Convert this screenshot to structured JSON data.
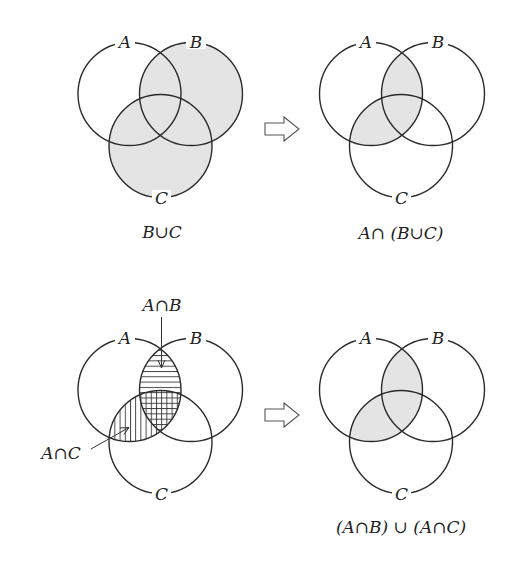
{
  "figure": {
    "panels": [
      {
        "id": "b-union-c",
        "position": "top-left",
        "caption": "B∪C",
        "shaded_region": "B∪C",
        "circle_labels": {
          "a": "A",
          "b": "B",
          "c": "C"
        }
      },
      {
        "id": "a-intersect-b-union-c",
        "position": "top-right",
        "caption": "A∩ (B∪C)",
        "shaded_region": "A∩(B∪C)",
        "circle_labels": {
          "a": "A",
          "b": "B",
          "c": "C"
        }
      },
      {
        "id": "hatched-intersections",
        "position": "bottom-left",
        "caption": "",
        "shaded_region": "A∩B (horizontal hatch), A∩C (vertical hatch)",
        "circle_labels": {
          "a": "A",
          "b": "B",
          "c": "C"
        },
        "callouts": [
          {
            "text": "A∩B",
            "target": "A∩B",
            "hatch": "horizontal"
          },
          {
            "text": "A∩C",
            "target": "A∩C",
            "hatch": "vertical"
          }
        ]
      },
      {
        "id": "ab-union-ac",
        "position": "bottom-right",
        "caption": "(A∩B) ∪ (A∩C)",
        "shaded_region": "(A∩B)∪(A∩C)",
        "circle_labels": {
          "a": "A",
          "b": "B",
          "c": "C"
        }
      }
    ],
    "arrows": [
      {
        "icon": "hollow-right-arrow-icon",
        "from": "b-union-c",
        "to": "a-intersect-b-union-c"
      },
      {
        "icon": "hollow-right-arrow-icon",
        "from": "hatched-intersections",
        "to": "ab-union-ac"
      }
    ],
    "colors": {
      "stroke": "#2b2b2b",
      "shade": "#e4e4e4",
      "hatch": "#333333",
      "background": "#ffffff"
    }
  }
}
